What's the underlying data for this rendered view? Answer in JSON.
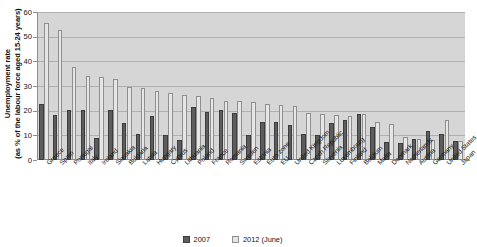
{
  "chart_data": {
    "type": "bar",
    "title": "",
    "xlabel": "",
    "ylabel": "Unemployment rate (as % of the labour force aged 15-24 years)",
    "ylabel_line1": "Unemployment rate",
    "ylabel_line2": "(as % of the labour force aged 15-24 years)",
    "ylim": [
      0,
      60
    ],
    "yticks": [
      0,
      10,
      20,
      30,
      40,
      50,
      60
    ],
    "grid": true,
    "legend_position": "bottom",
    "categories": [
      "Greece",
      "Spain",
      "Portugal",
      "Italy",
      "Ireland",
      "Slovakia",
      "Bulgaria",
      "Latvia",
      "Hungary",
      "Cyprus",
      "Lithuania",
      "Poland",
      "France",
      "Romania",
      "Sweden",
      "Estonia",
      "Euro zone",
      "EU",
      "United Kingdom",
      "Czech Republic",
      "Slovenia",
      "Luxembourg",
      "Finland",
      "Belgium",
      "Malta",
      "Denmark",
      "Netherlands",
      "Austria",
      "Germany",
      "United States",
      "Japan"
    ],
    "series": [
      {
        "name": "2007",
        "color": "#5d5d5d",
        "values": [
          22.7,
          18.1,
          20.4,
          20.4,
          8.9,
          20.4,
          15.2,
          10.6,
          18.0,
          10.1,
          8.2,
          21.6,
          19.5,
          20.1,
          19.2,
          10.0,
          15.6,
          15.6,
          14.3,
          10.7,
          10.1,
          15.2,
          16.3,
          18.8,
          13.5,
          7.5,
          7.0,
          8.7,
          11.8,
          10.5,
          7.7
        ]
      },
      {
        "name": "2012 (June)",
        "color": "#e6e6e6",
        "values": [
          55.4,
          52.7,
          37.6,
          33.9,
          33.6,
          33.0,
          29.5,
          29.3,
          27.9,
          27.0,
          26.4,
          25.8,
          25.0,
          24.0,
          23.8,
          23.6,
          22.6,
          22.5,
          21.9,
          19.2,
          18.5,
          18.2,
          18.0,
          18.8,
          15.4,
          14.6,
          9.3,
          8.7,
          8.0,
          16.4,
          7.9
        ]
      }
    ]
  },
  "legend": {
    "items": [
      {
        "label": "2007"
      },
      {
        "label": "2012 (June)"
      }
    ]
  }
}
